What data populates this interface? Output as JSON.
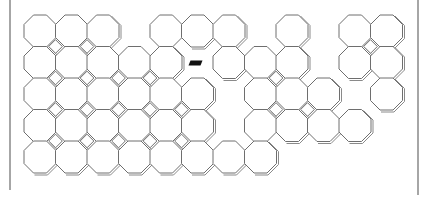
{
  "board": {
    "origin": {
      "x": 24,
      "y": 15
    },
    "pitch": 31.5,
    "octagon_size": 32,
    "corner_cut": 9.5,
    "colors": {
      "outline": "#6e6e6e",
      "shadow": "#8a8a8a",
      "fill": "#ffffff",
      "frame": "#888888",
      "marker": "#111111"
    },
    "rows": [
      {
        "row": 0,
        "cols": [
          0,
          1,
          2,
          4,
          5,
          6,
          8,
          10,
          11
        ]
      },
      {
        "row": 1,
        "cols": [
          0,
          1,
          2,
          3,
          4,
          6,
          7,
          8,
          10,
          11
        ]
      },
      {
        "row": 2,
        "cols": [
          0,
          1,
          2,
          3,
          4,
          5,
          7,
          8,
          9,
          11
        ]
      },
      {
        "row": 3,
        "cols": [
          0,
          1,
          2,
          3,
          4,
          5,
          7,
          8,
          9,
          10
        ]
      },
      {
        "row": 4,
        "cols": [
          0,
          1,
          2,
          3,
          4,
          5,
          6,
          7
        ]
      }
    ],
    "marker": {
      "row": 1,
      "col": 5,
      "shape": "parallelogram"
    },
    "frame": {
      "left": {
        "x": 10,
        "y1": 0,
        "y2": 190
      },
      "right": {
        "x": 418,
        "y1": 0,
        "y2": 195
      }
    }
  }
}
